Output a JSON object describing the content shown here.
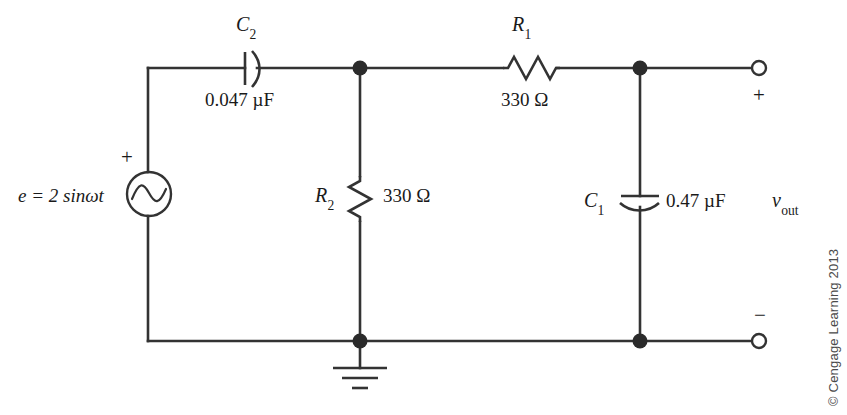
{
  "figure": {
    "type": "circuit-schematic",
    "credit": "© Cengage Learning 2013",
    "line_color": "#333333",
    "text_color": "#1a1a1a"
  },
  "source": {
    "name": "ac-voltage-source",
    "equation": "e = 2 sin",
    "equation_symbol": "ω",
    "equation_tail": "t",
    "polarity_plus": "+",
    "symbol": "sine-wave-circle"
  },
  "components": {
    "c2": {
      "ref": "C",
      "ref_sub": "2",
      "value": "0.047 µF",
      "symbol": "capacitor-curved-plate",
      "orientation": "horizontal"
    },
    "r1": {
      "ref": "R",
      "ref_sub": "1",
      "value": "330 Ω",
      "symbol": "resistor-zigzag",
      "orientation": "horizontal"
    },
    "r2": {
      "ref": "R",
      "ref_sub": "2",
      "value": "330 Ω",
      "symbol": "resistor-zigzag",
      "orientation": "vertical"
    },
    "c1": {
      "ref": "C",
      "ref_sub": "1",
      "value": "0.47 µF",
      "symbol": "capacitor-curved-plate",
      "orientation": "vertical"
    },
    "ground": {
      "name": "earth-ground",
      "symbol": "ground-three-bars"
    }
  },
  "output": {
    "label": "v",
    "label_sub": "out",
    "terminal_plus": "+",
    "terminal_minus": "−",
    "top_terminal": "open-circle-terminal",
    "bottom_terminal": "open-circle-terminal"
  },
  "nodes": [
    {
      "name": "node-a-top",
      "x": 360,
      "y": 68
    },
    {
      "name": "node-b-top",
      "x": 640,
      "y": 68
    },
    {
      "name": "node-a-bottom",
      "x": 360,
      "y": 341
    },
    {
      "name": "node-b-bottom",
      "x": 640,
      "y": 341
    }
  ]
}
